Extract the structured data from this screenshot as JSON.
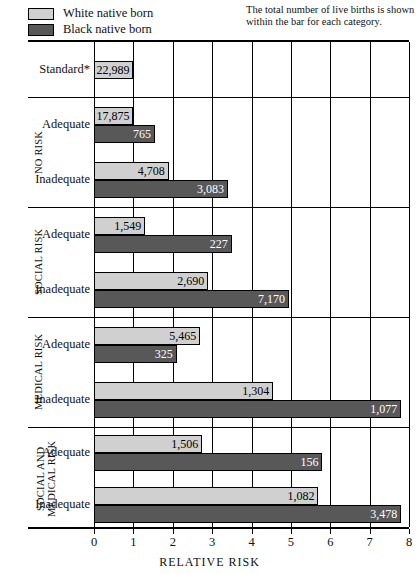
{
  "legend": {
    "items": [
      {
        "label": "White native born",
        "swatch": "light-gray-swatch",
        "color": "#d0d0d0"
      },
      {
        "label": "Black native born",
        "swatch": "dark-gray-swatch",
        "color": "#585858"
      }
    ]
  },
  "note": "The total number of live births is shown within the bar for each category.",
  "axis": {
    "title": "RELATIVE  RISK",
    "ticks": [
      "0",
      "1",
      "2",
      "3",
      "4",
      "5",
      "6",
      "7",
      "8"
    ],
    "min": 0,
    "max": 8
  },
  "chart_data": {
    "type": "bar",
    "orientation": "horizontal",
    "title": "",
    "xlabel": "RELATIVE  RISK",
    "ylabel": "",
    "xlim": [
      0,
      8
    ],
    "grid": "vertical",
    "legend_position": "top-left",
    "categories": [
      "Standard*",
      "No risk / Adequate",
      "No risk / Inadequate",
      "Social risk / Adequate",
      "Social risk / Inadequate",
      "Medical risk / Adequate",
      "Medical risk / Inadequate",
      "Social and medical risk / Adequate",
      "Social and medical risk / Inadequate"
    ],
    "series": [
      {
        "name": "White native born",
        "color": "#d0d0d0",
        "values": [
          1.0,
          1.0,
          1.9,
          1.3,
          2.9,
          2.7,
          4.55,
          2.75,
          5.7
        ],
        "labels": [
          "22,989",
          "17,875",
          "4,708",
          "1,549",
          "2,690",
          "5,465",
          "1,304",
          "1,506",
          "1,082"
        ]
      },
      {
        "name": "Black native born",
        "color": "#585858",
        "values": [
          null,
          1.55,
          3.4,
          3.5,
          4.95,
          2.1,
          7.8,
          5.8,
          7.8
        ],
        "labels": [
          null,
          "765",
          "3,083",
          "227",
          "7,170",
          "325",
          "1,077",
          "156",
          "3,478"
        ]
      }
    ],
    "note": "The total number of live births is shown within the bar for each category."
  },
  "groups": [
    {
      "title": "",
      "rows": [
        {
          "label": "Standard*",
          "white": {
            "value": 1.0,
            "text": "22,989"
          }
        }
      ]
    },
    {
      "title": "NO RISK",
      "rows": [
        {
          "label": "Adequate",
          "white": {
            "value": 1.0,
            "text": "17,875"
          },
          "black": {
            "value": 1.55,
            "text": "765"
          }
        },
        {
          "label": "Inadequate",
          "white": {
            "value": 1.9,
            "text": "4,708"
          },
          "black": {
            "value": 3.4,
            "text": "3,083"
          }
        }
      ]
    },
    {
      "title": "SOCIAL RISK",
      "rows": [
        {
          "label": "Adequate",
          "white": {
            "value": 1.3,
            "text": "1,549"
          },
          "black": {
            "value": 3.5,
            "text": "227"
          }
        },
        {
          "label": "Inadequate",
          "white": {
            "value": 2.9,
            "text": "2,690"
          },
          "black": {
            "value": 4.95,
            "text": "7,170"
          }
        }
      ]
    },
    {
      "title": "MEDICAL RISK",
      "rows": [
        {
          "label": "Adequate",
          "white": {
            "value": 2.7,
            "text": "5,465"
          },
          "black": {
            "value": 2.1,
            "text": "325"
          }
        },
        {
          "label": "Inadequate",
          "white": {
            "value": 4.55,
            "text": "1,304"
          },
          "black": {
            "value": 7.8,
            "text": "1,077"
          }
        }
      ]
    },
    {
      "title": "SOCIAL AND\nMEDICAL RISK",
      "rows": [
        {
          "label": "Adequate",
          "white": {
            "value": 2.75,
            "text": "1,506"
          },
          "black": {
            "value": 5.8,
            "text": "156"
          }
        },
        {
          "label": "Inadequate",
          "white": {
            "value": 5.7,
            "text": "1,082"
          },
          "black": {
            "value": 7.8,
            "text": "3,478"
          }
        }
      ]
    }
  ]
}
